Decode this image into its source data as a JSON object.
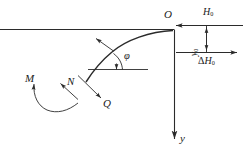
{
  "figure": {
    "stroke_color": "#2b2b2b",
    "labels": {
      "origin": "O",
      "y_axis": "y",
      "angle_phi": "φ",
      "moment": "M",
      "normal_force": "N",
      "shear_force": "Q",
      "horizontal_force_base": "H",
      "horizontal_force_sub": "0",
      "delta_symbol": "Δ",
      "delta_h_base": "H",
      "delta_h_sub": "0",
      "vertical_dim_base": "y",
      "vertical_dim_sub": "0"
    }
  }
}
